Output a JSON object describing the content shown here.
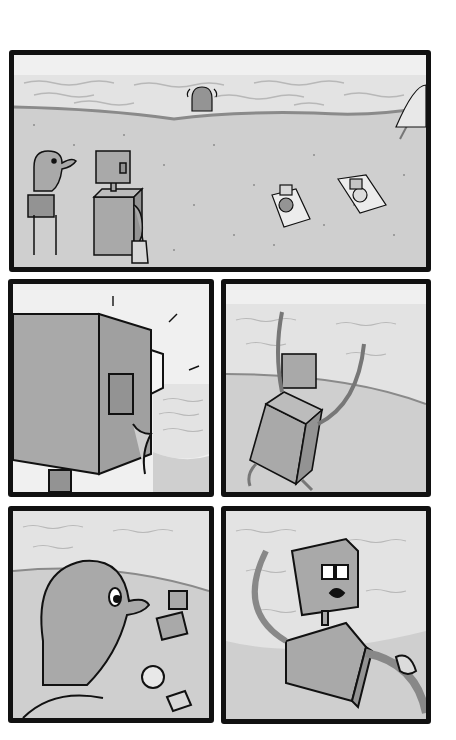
{
  "page": {
    "type": "wordless comic page",
    "background": "#ffffff",
    "panel_border_color": "#111111"
  },
  "palette": {
    "sky": "#f0f0f0",
    "water": "#e3e3e3",
    "wave_line": "#b8b8b8",
    "shoreline": "#8a8a8a",
    "sand": "#cfcfcf",
    "sand_dot": "#8c8c8c",
    "character_fill": "#a9a9a9",
    "character_shade": "#939393",
    "outline": "#111111",
    "towel": "#ececec"
  },
  "panels": [
    {
      "id": 1,
      "caption": "",
      "description": "Wide beach scene: dog with backpack and box robot with tote bag stand at left looking at the sea; a figure stands at the waterline; two characters sunbathe on towels; beach umbrella at right edge."
    },
    {
      "id": 2,
      "caption": "",
      "description": "Close-up of the robot's box head from behind, turning toward the sea."
    },
    {
      "id": 3,
      "caption": "",
      "description": "Robot runs toward the water with both arms raised."
    },
    {
      "id": 4,
      "caption": "",
      "description": "Dog watches from behind as the robot runs off, leaving a ball and the tote bag on the sand."
    },
    {
      "id": 5,
      "caption": "",
      "description": "Robot stops, looking alarmed, as a hand grabs its arm hose from the right."
    }
  ]
}
